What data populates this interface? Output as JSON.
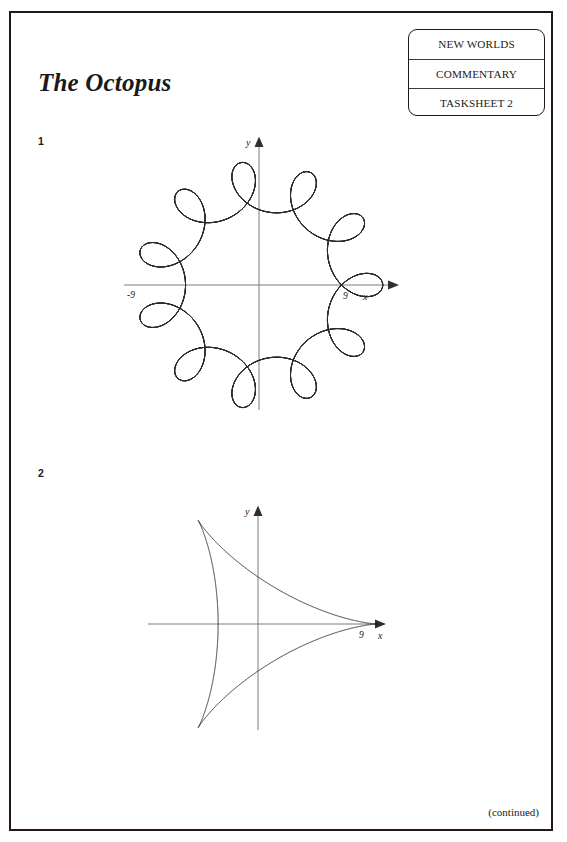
{
  "document": {
    "title": "The Octopus",
    "footer_note": "(continued)"
  },
  "stamp": {
    "line1": "NEW WORLDS",
    "line2": "COMMENTARY",
    "line3": "TASKSHEET 2"
  },
  "questions": [
    {
      "number": "1"
    },
    {
      "number": "2"
    }
  ],
  "chart_data": [
    {
      "type": "line",
      "name": "octopus-curve",
      "title": "",
      "xlabel": "x",
      "ylabel": "y",
      "xlim": [
        -11,
        11
      ],
      "ylim": [
        -11,
        11
      ],
      "grid": false,
      "legend": null,
      "x_ticks": [
        -9,
        9
      ],
      "x_tick_labels": [
        "-9",
        "9"
      ],
      "y_ticks": [],
      "y_tick_labels": [],
      "annotations": [
        "-9",
        "9",
        "x",
        "y"
      ],
      "description": "Ten-petalled hypotrochoid with small outward loops at each of ten equally spaced directions; outermost reach 9 on the x-axis.",
      "parametric": {
        "form": "r = a*cos(k*t) style hypotrochoid with loops",
        "R": 9,
        "loops": 10,
        "inner_radius": 7.2,
        "loop_tip_radius": 9.0
      }
    },
    {
      "type": "line",
      "name": "deltoid-curve",
      "title": "",
      "xlabel": "x",
      "ylabel": "y",
      "xlim": [
        -11,
        11
      ],
      "ylim": [
        -11,
        11
      ],
      "grid": false,
      "legend": null,
      "x_ticks": [
        9
      ],
      "x_tick_labels": [
        "9"
      ],
      "y_ticks": [],
      "y_tick_labels": [],
      "annotations": [
        "9",
        "x",
        "y"
      ],
      "description": "Three-cusped hypocycloid (deltoid) with cusps at 9 on the positive x-axis and two at the upper-left and lower-left.",
      "parametric": {
        "form": "deltoid, 3 cusps",
        "R": 9,
        "cusps": 3
      }
    }
  ],
  "colors": {
    "ink": "#231815",
    "curve": "#2a2a2a",
    "axis": "#6e6e6e",
    "paper": "#ffffff"
  }
}
